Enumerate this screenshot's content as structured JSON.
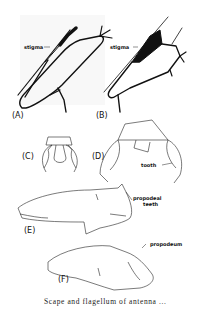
{
  "figure": {
    "panels": [
      {
        "id": "A",
        "label": "(A)",
        "annotations": [
          "stigma"
        ]
      },
      {
        "id": "B",
        "label": "(B)",
        "annotations": [
          "stigma"
        ]
      },
      {
        "id": "C",
        "label": "(C)",
        "annotations": []
      },
      {
        "id": "D",
        "label": "(D)",
        "annotations": [
          "tooth"
        ]
      },
      {
        "id": "E",
        "label": "(E)",
        "annotations": [
          "propodeal teeth"
        ]
      },
      {
        "id": "F",
        "label": "(F)",
        "annotations": [
          "propodeum"
        ]
      }
    ],
    "annotation_text": {
      "stigma_a": "stigma",
      "stigma_b": "stigma",
      "tooth": "tooth",
      "propodeal_line1": "propodeal",
      "propodeal_line2": "teeth",
      "propodeum": "propodeum"
    },
    "caption": "Scape and flagellum of antenna ..."
  }
}
